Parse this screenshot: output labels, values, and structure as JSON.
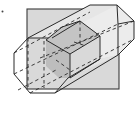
{
  "figure": {
    "label_dot": ".",
    "colors": {
      "plane_fill": "#d9d9d9",
      "prism_fill": "#efefef",
      "section_fill": "#bdbdbd",
      "section_side_fill": "#d0d0d0",
      "stroke": "#2a2a2a",
      "background": "#ffffff"
    },
    "plane": {
      "x": 27,
      "y": 9,
      "width": 92,
      "height": 80
    },
    "front_face": "28,38 14,53 14,74 30,93 55,93 68,78 68,56 52,38",
    "back_face_top": "90,5 117,5 134,21 134,39 118,55",
    "section_front": "46,40 62,27 80,21 100,36 100,59 70,78 70,54",
    "section_side": "70,54 100,36 100,59 70,78"
  }
}
